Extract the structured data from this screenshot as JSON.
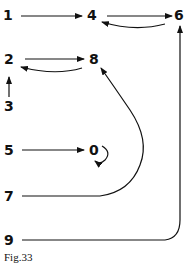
{
  "diagram": {
    "caption": "Fig.33",
    "nodes": [
      {
        "id": "n1",
        "label": "1"
      },
      {
        "id": "n4",
        "label": "4"
      },
      {
        "id": "n6",
        "label": "6"
      },
      {
        "id": "n2",
        "label": "2"
      },
      {
        "id": "n8",
        "label": "8"
      },
      {
        "id": "n3",
        "label": "3"
      },
      {
        "id": "n5",
        "label": "5"
      },
      {
        "id": "n0",
        "label": "0"
      },
      {
        "id": "n7",
        "label": "7"
      },
      {
        "id": "n9",
        "label": "9"
      }
    ],
    "edges": [
      {
        "from": "1",
        "to": "4"
      },
      {
        "from": "4",
        "to": "6"
      },
      {
        "from": "6",
        "to": "4"
      },
      {
        "from": "2",
        "to": "8"
      },
      {
        "from": "8",
        "to": "2"
      },
      {
        "from": "3",
        "to": "2"
      },
      {
        "from": "5",
        "to": "0"
      },
      {
        "from": "0",
        "to": "0"
      },
      {
        "from": "7",
        "to": "8"
      },
      {
        "from": "9",
        "to": "6"
      }
    ]
  }
}
